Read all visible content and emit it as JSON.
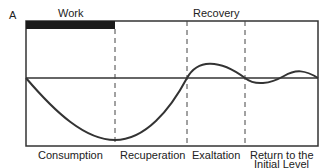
{
  "diagram": {
    "corner_label": "A",
    "top_labels": {
      "work": "Work",
      "recovery": "Recovery"
    },
    "phases": [
      {
        "label": "Consumption"
      },
      {
        "label": "Recuperation"
      },
      {
        "label": "Exaltation"
      },
      {
        "label": "Return to the",
        "label2": "Initial Level"
      }
    ],
    "colors": {
      "line": "#333333",
      "work_bar": "#1a1a1a",
      "background": "#ffffff"
    }
  }
}
